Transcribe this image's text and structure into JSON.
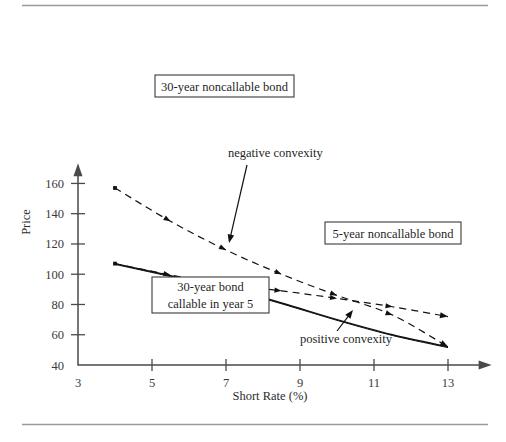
{
  "figure": {
    "has_top_rule": true,
    "has_bottom_rule": true,
    "background": "#ffffff",
    "ink": "#111111"
  },
  "chart_data": {
    "type": "line",
    "title": "",
    "xlabel": "Short Rate (%)",
    "ylabel": "Price",
    "xlim": [
      3,
      13.8
    ],
    "ylim": [
      40,
      168
    ],
    "xticks": [
      3,
      5,
      7,
      9,
      11,
      13
    ],
    "yticks": [
      40,
      60,
      80,
      100,
      120,
      140,
      160
    ],
    "grid": false,
    "legend": "boxed-callouts",
    "series": [
      {
        "name": "30-year noncallable bond",
        "style": "dashed",
        "marker": "dot-arrow",
        "x": [
          4,
          5.5,
          7,
          8.5,
          10,
          11.5,
          13
        ],
        "y": [
          157,
          135,
          116,
          100,
          86,
          73,
          52
        ]
      },
      {
        "name": "5-year noncallable bond",
        "style": "dashed",
        "marker": "dot-arrow",
        "x": [
          4,
          5.5,
          7,
          8.5,
          10,
          11.5,
          13
        ],
        "y": [
          107,
          99.5,
          93,
          89,
          84,
          78.5,
          72
        ]
      },
      {
        "name": "30-year bond callable in year 5",
        "style": "solid",
        "marker": "none",
        "x": [
          4,
          5.5,
          7,
          8.5,
          10,
          11.5,
          13
        ],
        "y": [
          107,
          99,
          91,
          81,
          70,
          60,
          52
        ]
      },
      {
        "name": "30-year bond callable in year 5 (inner)",
        "style": "solid-thin",
        "marker": "none",
        "x": [
          4,
          5.5,
          7,
          8.5,
          10,
          11.5,
          13
        ],
        "y": [
          106.5,
          98.5,
          90.5,
          80.5,
          69.5,
          59.5,
          51.5
        ]
      }
    ],
    "callouts": [
      {
        "id": "box-30y-noncallable",
        "text": "30-year noncallable bond",
        "boxed": true,
        "lines": [
          "30-year noncallable bond"
        ],
        "box": {
          "x": 155,
          "y": 75,
          "w": 139,
          "h": 22
        }
      },
      {
        "id": "box-5y-noncallable",
        "text": "5-year noncallable bond",
        "boxed": true,
        "lines": [
          "5-year noncallable bond"
        ],
        "box": {
          "x": 325,
          "y": 222,
          "w": 136,
          "h": 22
        }
      },
      {
        "id": "box-30y-callable",
        "text": "30-year bond callable in year 5",
        "boxed": true,
        "lines": [
          "30-year bond",
          "callable in year 5"
        ],
        "box": {
          "x": 152,
          "y": 277,
          "w": 117,
          "h": 36
        }
      }
    ],
    "annotations": [
      {
        "id": "negative-convexity",
        "text": "negative convexity",
        "text_x": 228,
        "text_y": 157,
        "arrow_from": [
          247,
          165
        ],
        "arrow_to": [
          229,
          243
        ]
      },
      {
        "id": "positive-convexity",
        "text": "positive convexity",
        "text_x": 300,
        "text_y": 343,
        "arrow_from": [
          337,
          331
        ],
        "arrow_to": [
          353,
          310
        ]
      }
    ]
  }
}
